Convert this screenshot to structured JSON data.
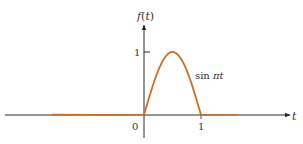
{
  "chart_data": {
    "type": "line",
    "title": "",
    "xlabel": "t",
    "ylabel": "f(t)",
    "curve_label": "sin πt",
    "x_ticks": [
      "0",
      "1"
    ],
    "y_ticks": [
      "1"
    ],
    "xlim": [
      -2.2,
      1.8
    ],
    "ylim": [
      -0.35,
      1.5
    ],
    "grid": false,
    "legend": null,
    "series": [
      {
        "name": "f(t)",
        "color": "#c8702a",
        "piecewise": [
          {
            "domain": [
              -1.6,
              0
            ],
            "expr": "0"
          },
          {
            "domain": [
              0,
              1
            ],
            "expr": "sin(πt)"
          },
          {
            "domain": [
              1,
              1.4
            ],
            "expr": "0"
          }
        ],
        "x": [
          0,
          0.1,
          0.2,
          0.3,
          0.4,
          0.5,
          0.6,
          0.7,
          0.8,
          0.9,
          1.0
        ],
        "y": [
          0,
          0.309,
          0.588,
          0.809,
          0.951,
          1.0,
          0.951,
          0.809,
          0.588,
          0.309,
          0
        ]
      }
    ]
  },
  "labels": {
    "y_axis": "f(t)",
    "x_axis": "t",
    "origin": "0",
    "x_tick_1": "1",
    "y_tick_1": "1",
    "curve": "sin πt"
  },
  "colors": {
    "axis": "#2a2a2a",
    "curve": "#c8702a"
  }
}
